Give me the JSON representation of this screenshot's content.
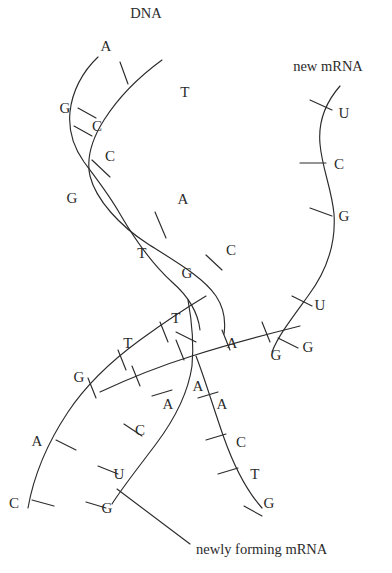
{
  "figure": {
    "title_label": "DNA",
    "mrna_label": "new mRNA",
    "forming_label": "newly forming mRNA",
    "stroke_color": "#2b2b2b",
    "background_color": "#ffffff"
  },
  "labels": {
    "dna": {
      "text": "DNA",
      "x": 146,
      "y": 13
    },
    "new_mrna": {
      "text": "new mRNA",
      "x": 328,
      "y": 66
    },
    "newly_forming_mrna": {
      "text": "newly forming mRNA",
      "x": 205,
      "y": 549
    }
  },
  "helix_top": {
    "description": "intact DNA double helix, upper portion",
    "left_strand_bases": [
      {
        "base": "A",
        "x": 106,
        "y": 46
      },
      {
        "base": "G",
        "x": 65,
        "y": 108
      },
      {
        "base": "C",
        "x": 97,
        "y": 126
      },
      {
        "base": "C",
        "x": 110,
        "y": 156
      },
      {
        "base": "G",
        "x": 72,
        "y": 198
      },
      {
        "base": "T",
        "x": 142,
        "y": 253
      }
    ],
    "right_strand_bases": [
      {
        "base": "T",
        "x": 185,
        "y": 92
      },
      {
        "base": "A",
        "x": 183,
        "y": 199
      },
      {
        "base": "C",
        "x": 231,
        "y": 250
      },
      {
        "base": "G",
        "x": 187,
        "y": 273
      }
    ]
  },
  "fork": {
    "description": "transcription fork where the two DNA strands separate and mRNA is synthesised",
    "template_strand_bases": [
      {
        "base": "T",
        "x": 176,
        "y": 318
      },
      {
        "base": "T",
        "x": 128,
        "y": 343
      },
      {
        "base": "G",
        "x": 79,
        "y": 377
      },
      {
        "base": "A",
        "x": 37,
        "y": 441
      },
      {
        "base": "C",
        "x": 14,
        "y": 503
      }
    ],
    "coding_strand_bases": [
      {
        "base": "A",
        "x": 232,
        "y": 343
      },
      {
        "base": "G",
        "x": 276,
        "y": 355
      },
      {
        "base": "A",
        "x": 198,
        "y": 386
      },
      {
        "base": "A",
        "x": 222,
        "y": 404
      },
      {
        "base": "C",
        "x": 241,
        "y": 442
      },
      {
        "base": "T",
        "x": 255,
        "y": 474
      },
      {
        "base": "G",
        "x": 269,
        "y": 503
      }
    ],
    "nascent_bases": [
      {
        "base": "A",
        "x": 168,
        "y": 404
      },
      {
        "base": "C",
        "x": 140,
        "y": 430
      },
      {
        "base": "U",
        "x": 119,
        "y": 474
      },
      {
        "base": "G",
        "x": 107,
        "y": 508
      }
    ]
  },
  "mrna_strand": {
    "description": "released new mRNA strand on the right",
    "bases": [
      {
        "base": "U",
        "x": 344,
        "y": 113
      },
      {
        "base": "C",
        "x": 339,
        "y": 164
      },
      {
        "base": "G",
        "x": 344,
        "y": 216
      },
      {
        "base": "U",
        "x": 320,
        "y": 305
      },
      {
        "base": "G",
        "x": 308,
        "y": 347
      }
    ]
  }
}
